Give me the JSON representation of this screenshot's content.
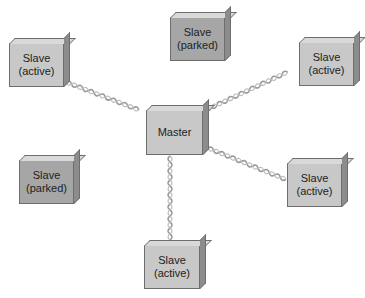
{
  "diagram": {
    "type": "piconet",
    "master": {
      "line1": "Master"
    },
    "nodes": [
      {
        "id": "slave-top-left",
        "line1": "Slave",
        "line2": "(active)",
        "state": "active"
      },
      {
        "id": "slave-top-center",
        "line1": "Slave",
        "line2": "(parked)",
        "state": "parked"
      },
      {
        "id": "slave-top-right",
        "line1": "Slave",
        "line2": "(active)",
        "state": "active"
      },
      {
        "id": "slave-mid-left",
        "line1": "Slave",
        "line2": "(parked)",
        "state": "parked"
      },
      {
        "id": "slave-mid-right",
        "line1": "Slave",
        "line2": "(active)",
        "state": "active"
      },
      {
        "id": "slave-bottom",
        "line1": "Slave",
        "line2": "(active)",
        "state": "active"
      }
    ],
    "links": [
      {
        "from": "master",
        "to": "slave-top-left"
      },
      {
        "from": "master",
        "to": "slave-top-right"
      },
      {
        "from": "master",
        "to": "slave-mid-right"
      },
      {
        "from": "master",
        "to": "slave-bottom"
      }
    ],
    "colors": {
      "active": "#c8c8c8",
      "parked": "#a6a6a6",
      "link": "#9a9a9a",
      "border": "#6e6e6e"
    }
  }
}
